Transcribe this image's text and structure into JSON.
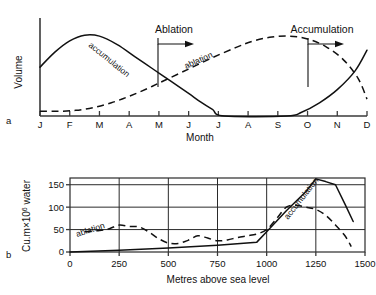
{
  "figure": {
    "panels": [
      {
        "letter": "a",
        "ylabel": "Volume",
        "xlabel": "Month"
      },
      {
        "letter": "b",
        "ylabel": "Cu.m×10",
        "ylabel_exponent": "6",
        "ylabel_tail": " water",
        "xlabel": "Metres above sea level"
      }
    ]
  },
  "chart_data": [
    {
      "type": "line",
      "title": "",
      "panel": "a",
      "xlabel": "Month",
      "ylabel": "Volume",
      "categories": [
        "J",
        "F",
        "M",
        "A",
        "M",
        "J",
        "J",
        "A",
        "S",
        "O",
        "N",
        "D"
      ],
      "xlim": [
        0,
        11
      ],
      "ylim": [
        0,
        100
      ],
      "grid": false,
      "y_ticks_shown": false,
      "annotations": [
        {
          "text": "Ablation",
          "x_month": "M",
          "arrow": "right"
        },
        {
          "text": "Accumulation",
          "x_month": "N",
          "arrow": "right"
        }
      ],
      "series": [
        {
          "name": "accumulation",
          "style": "solid",
          "inline_label": "accumulation",
          "x": [
            0,
            0.5,
            1.0,
            1.5,
            2.0,
            2.6,
            3.2,
            3.8,
            4.4,
            5.0,
            5.4,
            5.8,
            6.2,
            8.3,
            8.8,
            9.4,
            10.0,
            10.6,
            11.0
          ],
          "values": [
            52,
            68,
            80,
            86,
            85,
            76,
            63,
            50,
            37,
            24,
            15,
            7,
            0,
            0,
            4,
            14,
            28,
            48,
            70
          ]
        },
        {
          "name": "ablation",
          "style": "dashed",
          "inline_label": "ablation",
          "x": [
            0,
            0.6,
            1.2,
            1.8,
            2.4,
            3.0,
            3.6,
            4.2,
            5.0,
            5.8,
            6.6,
            7.2,
            7.8,
            8.4,
            9.0,
            9.6,
            10.2,
            10.7,
            11.0
          ],
          "values": [
            5,
            5,
            6,
            9,
            14,
            21,
            29,
            38,
            50,
            62,
            73,
            80,
            84,
            85,
            82,
            74,
            60,
            40,
            18
          ]
        }
      ]
    },
    {
      "type": "line",
      "title": "",
      "panel": "b",
      "xlabel": "Metres above sea level",
      "ylabel": "Cu.m×10^6 water",
      "xlim": [
        0,
        1500
      ],
      "ylim": [
        0,
        165
      ],
      "x_ticks": [
        0,
        250,
        500,
        750,
        1000,
        1250,
        1500
      ],
      "y_ticks": [
        0,
        50,
        100,
        150
      ],
      "grid": true,
      "grid_x": [
        250,
        500,
        750,
        1000,
        1250
      ],
      "grid_y": [
        50,
        100,
        150
      ],
      "series": [
        {
          "name": "ablation",
          "style": "dashed",
          "inline_label": "ablation",
          "x": [
            75,
            150,
            200,
            250,
            300,
            350,
            400,
            450,
            500,
            550,
            600,
            650,
            700,
            750,
            800,
            850,
            900,
            950,
            1000,
            1050,
            1100,
            1150,
            1200,
            1250,
            1300,
            1350,
            1400,
            1430
          ],
          "values": [
            45,
            48,
            52,
            60,
            57,
            56,
            45,
            30,
            20,
            19,
            26,
            36,
            31,
            25,
            27,
            32,
            36,
            40,
            50,
            74,
            100,
            104,
            100,
            95,
            82,
            60,
            35,
            12
          ]
        },
        {
          "name": "accumulation",
          "style": "solid",
          "inline_label": "accumulation",
          "x": [
            0,
            250,
            500,
            750,
            900,
            950,
            1000,
            1100,
            1200,
            1250,
            1300,
            1350,
            1400,
            1440
          ],
          "values": [
            0,
            4,
            9,
            15,
            20,
            22,
            45,
            92,
            135,
            163,
            157,
            150,
            105,
            68
          ]
        }
      ]
    }
  ]
}
